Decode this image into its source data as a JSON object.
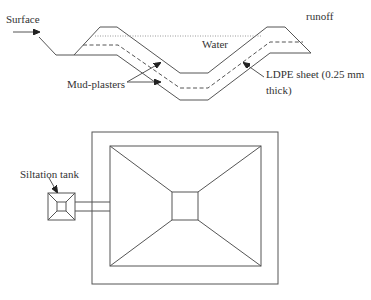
{
  "diagram": {
    "cross_section": {
      "labels": {
        "surface": "Surface",
        "runoff": "runoff",
        "water": "Water",
        "mud_plasters": "Mud-plasters",
        "ldpe_line1": "LDPE sheet (0.25 mm",
        "ldpe_line2": "thick)"
      }
    },
    "plan_view": {
      "labels": {
        "siltation_tank": "Siltation tank"
      }
    },
    "colors": {
      "line": "#555555",
      "text": "#333333",
      "background": "#ffffff"
    }
  }
}
